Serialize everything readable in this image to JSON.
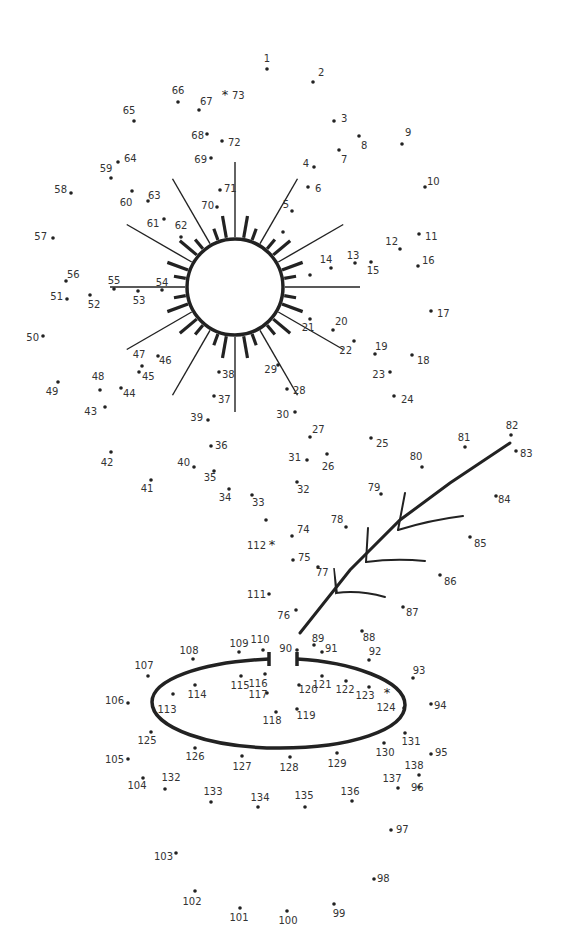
{
  "puzzle": {
    "type": "connect-the-dots",
    "total_points": 138,
    "points": [
      {
        "n": "1",
        "x": 267,
        "y": 69,
        "lx": 267,
        "ly": 62,
        "a": "middle"
      },
      {
        "n": "2",
        "x": 313,
        "y": 82,
        "lx": 318,
        "ly": 76,
        "a": "start"
      },
      {
        "n": "3",
        "x": 334,
        "y": 121,
        "lx": 341,
        "ly": 122,
        "a": "start"
      },
      {
        "n": "4",
        "x": 314,
        "y": 167,
        "lx": 309,
        "ly": 167,
        "a": "end"
      },
      {
        "n": "5",
        "x": 292,
        "y": 211,
        "lx": 289,
        "ly": 208,
        "a": "end"
      },
      {
        "n": "6",
        "x": 308,
        "y": 187,
        "lx": 315,
        "ly": 192,
        "a": "start"
      },
      {
        "n": "7",
        "x": 339,
        "y": 150,
        "lx": 341,
        "ly": 163,
        "a": "start"
      },
      {
        "n": "8",
        "x": 359,
        "y": 136,
        "lx": 361,
        "ly": 149,
        "a": "start"
      },
      {
        "n": "9",
        "x": 402,
        "y": 144,
        "lx": 405,
        "ly": 136,
        "a": "start"
      },
      {
        "n": "10",
        "x": 425,
        "y": 187,
        "lx": 427,
        "ly": 185,
        "a": "start"
      },
      {
        "n": "11",
        "x": 419,
        "y": 234,
        "lx": 425,
        "ly": 240,
        "a": "start"
      },
      {
        "n": "12",
        "x": 400,
        "y": 249,
        "lx": 398,
        "ly": 245,
        "a": "end"
      },
      {
        "n": "13",
        "x": 355,
        "y": 263,
        "lx": 353,
        "ly": 259,
        "a": "middle"
      },
      {
        "n": "14",
        "x": 331,
        "y": 268,
        "lx": 326,
        "ly": 263,
        "a": "middle"
      },
      {
        "n": "15",
        "x": 371,
        "y": 262,
        "lx": 373,
        "ly": 274,
        "a": "middle"
      },
      {
        "n": "16",
        "x": 418,
        "y": 266,
        "lx": 422,
        "ly": 264,
        "a": "start"
      },
      {
        "n": "17",
        "x": 431,
        "y": 311,
        "lx": 437,
        "ly": 317,
        "a": "start"
      },
      {
        "n": "18",
        "x": 412,
        "y": 355,
        "lx": 417,
        "ly": 364,
        "a": "start"
      },
      {
        "n": "19",
        "x": 375,
        "y": 354,
        "lx": 375,
        "ly": 350,
        "a": "start"
      },
      {
        "n": "20",
        "x": 333,
        "y": 330,
        "lx": 335,
        "ly": 325,
        "a": "start"
      },
      {
        "n": "21",
        "x": 310,
        "y": 319,
        "lx": 308,
        "ly": 331,
        "a": "middle"
      },
      {
        "n": "22",
        "x": 354,
        "y": 341,
        "lx": 352,
        "ly": 354,
        "a": "end"
      },
      {
        "n": "23",
        "x": 390,
        "y": 372,
        "lx": 385,
        "ly": 378,
        "a": "end"
      },
      {
        "n": "24",
        "x": 394,
        "y": 396,
        "lx": 401,
        "ly": 403,
        "a": "start"
      },
      {
        "n": "25",
        "x": 371,
        "y": 438,
        "lx": 376,
        "ly": 447,
        "a": "start"
      },
      {
        "n": "26",
        "x": 327,
        "y": 454,
        "lx": 328,
        "ly": 470,
        "a": "middle"
      },
      {
        "n": "27",
        "x": 310,
        "y": 437,
        "lx": 312,
        "ly": 433,
        "a": "start"
      },
      {
        "n": "28",
        "x": 287,
        "y": 389,
        "lx": 293,
        "ly": 394,
        "a": "start"
      },
      {
        "n": "29",
        "x": 278,
        "y": 365,
        "lx": 277,
        "ly": 373,
        "a": "end"
      },
      {
        "n": "30",
        "x": 295,
        "y": 412,
        "lx": 289,
        "ly": 418,
        "a": "end"
      },
      {
        "n": "31",
        "x": 307,
        "y": 460,
        "lx": 301,
        "ly": 461,
        "a": "end"
      },
      {
        "n": "32",
        "x": 297,
        "y": 482,
        "lx": 297,
        "ly": 493,
        "a": "start"
      },
      {
        "n": "33",
        "x": 252,
        "y": 495,
        "lx": 252,
        "ly": 506,
        "a": "start"
      },
      {
        "n": "34",
        "x": 229,
        "y": 489,
        "lx": 225,
        "ly": 501,
        "a": "middle"
      },
      {
        "n": "35",
        "x": 214,
        "y": 471,
        "lx": 210,
        "ly": 481,
        "a": "middle"
      },
      {
        "n": "36",
        "x": 211,
        "y": 446,
        "lx": 215,
        "ly": 449,
        "a": "start"
      },
      {
        "n": "37",
        "x": 214,
        "y": 396,
        "lx": 218,
        "ly": 403,
        "a": "start"
      },
      {
        "n": "38",
        "x": 219,
        "y": 372,
        "lx": 222,
        "ly": 378,
        "a": "start"
      },
      {
        "n": "39",
        "x": 208,
        "y": 420,
        "lx": 203,
        "ly": 421,
        "a": "end"
      },
      {
        "n": "40",
        "x": 194,
        "y": 467,
        "lx": 190,
        "ly": 466,
        "a": "end"
      },
      {
        "n": "41",
        "x": 151,
        "y": 480,
        "lx": 147,
        "ly": 492,
        "a": "middle"
      },
      {
        "n": "42",
        "x": 111,
        "y": 452,
        "lx": 107,
        "ly": 466,
        "a": "middle"
      },
      {
        "n": "43",
        "x": 105,
        "y": 407,
        "lx": 97,
        "ly": 415,
        "a": "end"
      },
      {
        "n": "44",
        "x": 121,
        "y": 388,
        "lx": 123,
        "ly": 397,
        "a": "start"
      },
      {
        "n": "45",
        "x": 139,
        "y": 372,
        "lx": 142,
        "ly": 380,
        "a": "start"
      },
      {
        "n": "46",
        "x": 158,
        "y": 356,
        "lx": 159,
        "ly": 364,
        "a": "start"
      },
      {
        "n": "47",
        "x": 142,
        "y": 366,
        "lx": 139,
        "ly": 358,
        "a": "middle"
      },
      {
        "n": "48",
        "x": 100,
        "y": 390,
        "lx": 98,
        "ly": 380,
        "a": "middle"
      },
      {
        "n": "49",
        "x": 58,
        "y": 382,
        "lx": 52,
        "ly": 395,
        "a": "middle"
      },
      {
        "n": "50",
        "x": 43,
        "y": 336,
        "lx": 39,
        "ly": 341,
        "a": "end"
      },
      {
        "n": "51",
        "x": 67,
        "y": 299,
        "lx": 63,
        "ly": 300,
        "a": "end"
      },
      {
        "n": "52",
        "x": 90,
        "y": 295,
        "lx": 94,
        "ly": 308,
        "a": "middle"
      },
      {
        "n": "53",
        "x": 138,
        "y": 291,
        "lx": 139,
        "ly": 304,
        "a": "middle"
      },
      {
        "n": "54",
        "x": 162,
        "y": 290,
        "lx": 162,
        "ly": 286,
        "a": "middle"
      },
      {
        "n": "55",
        "x": 114,
        "y": 289,
        "lx": 114,
        "ly": 284,
        "a": "middle"
      },
      {
        "n": "56",
        "x": 66,
        "y": 281,
        "lx": 67,
        "ly": 278,
        "a": "start"
      },
      {
        "n": "57",
        "x": 53,
        "y": 238,
        "lx": 47,
        "ly": 240,
        "a": "end"
      },
      {
        "n": "58",
        "x": 71,
        "y": 193,
        "lx": 67,
        "ly": 193,
        "a": "end"
      },
      {
        "n": "59",
        "x": 111,
        "y": 178,
        "lx": 106,
        "ly": 172,
        "a": "middle"
      },
      {
        "n": "60",
        "x": 132,
        "y": 191,
        "lx": 126,
        "ly": 206,
        "a": "middle"
      },
      {
        "n": "61",
        "x": 164,
        "y": 219,
        "lx": 153,
        "ly": 227,
        "a": "middle"
      },
      {
        "n": "62",
        "x": 181,
        "y": 237,
        "lx": 181,
        "ly": 229,
        "a": "middle"
      },
      {
        "n": "63",
        "x": 148,
        "y": 201,
        "lx": 148,
        "ly": 199,
        "a": "start"
      },
      {
        "n": "64",
        "x": 118,
        "y": 162,
        "lx": 124,
        "ly": 162,
        "a": "start"
      },
      {
        "n": "65",
        "x": 134,
        "y": 121,
        "lx": 129,
        "ly": 114,
        "a": "middle"
      },
      {
        "n": "66",
        "x": 178,
        "y": 102,
        "lx": 178,
        "ly": 94,
        "a": "middle"
      },
      {
        "n": "67",
        "x": 199,
        "y": 110,
        "lx": 200,
        "ly": 105,
        "a": "start"
      },
      {
        "n": "68",
        "x": 207,
        "y": 134,
        "lx": 204,
        "ly": 139,
        "a": "end"
      },
      {
        "n": "69",
        "x": 211,
        "y": 158,
        "lx": 207,
        "ly": 163,
        "a": "end"
      },
      {
        "n": "70",
        "x": 217,
        "y": 207,
        "lx": 214,
        "ly": 209,
        "a": "end"
      },
      {
        "n": "71",
        "x": 220,
        "y": 190,
        "lx": 224,
        "ly": 192,
        "a": "start"
      },
      {
        "n": "72",
        "x": 222,
        "y": 141,
        "lx": 228,
        "ly": 146,
        "a": "start"
      },
      {
        "n": "74",
        "x": 292,
        "y": 536,
        "lx": 297,
        "ly": 533,
        "a": "start"
      },
      {
        "n": "75",
        "x": 293,
        "y": 560,
        "lx": 298,
        "ly": 561,
        "a": "start"
      },
      {
        "n": "76",
        "x": 296,
        "y": 610,
        "lx": 290,
        "ly": 619,
        "a": "end"
      },
      {
        "n": "77",
        "x": 318,
        "y": 567,
        "lx": 316,
        "ly": 576,
        "a": "start"
      },
      {
        "n": "78",
        "x": 346,
        "y": 527,
        "lx": 337,
        "ly": 523,
        "a": "middle"
      },
      {
        "n": "79",
        "x": 381,
        "y": 494,
        "lx": 374,
        "ly": 491,
        "a": "middle"
      },
      {
        "n": "80",
        "x": 422,
        "y": 467,
        "lx": 416,
        "ly": 460,
        "a": "middle"
      },
      {
        "n": "81",
        "x": 465,
        "y": 447,
        "lx": 464,
        "ly": 441,
        "a": "middle"
      },
      {
        "n": "82",
        "x": 511,
        "y": 435,
        "lx": 512,
        "ly": 429,
        "a": "middle"
      },
      {
        "n": "83",
        "x": 516,
        "y": 451,
        "lx": 520,
        "ly": 457,
        "a": "start"
      },
      {
        "n": "84",
        "x": 496,
        "y": 496,
        "lx": 498,
        "ly": 503,
        "a": "start"
      },
      {
        "n": "85",
        "x": 470,
        "y": 537,
        "lx": 474,
        "ly": 547,
        "a": "start"
      },
      {
        "n": "86",
        "x": 440,
        "y": 575,
        "lx": 444,
        "ly": 585,
        "a": "start"
      },
      {
        "n": "87",
        "x": 403,
        "y": 607,
        "lx": 406,
        "ly": 616,
        "a": "start"
      },
      {
        "n": "88",
        "x": 362,
        "y": 631,
        "lx": 369,
        "ly": 641,
        "a": "middle"
      },
      {
        "n": "89",
        "x": 314,
        "y": 645,
        "lx": 318,
        "ly": 642,
        "a": "middle"
      },
      {
        "n": "90",
        "x": 297,
        "y": 650,
        "lx": 292,
        "ly": 652,
        "a": "end"
      },
      {
        "n": "91",
        "x": 322,
        "y": 652,
        "lx": 325,
        "ly": 652,
        "a": "start"
      },
      {
        "n": "92",
        "x": 369,
        "y": 660,
        "lx": 375,
        "ly": 655,
        "a": "middle"
      },
      {
        "n": "93",
        "x": 413,
        "y": 678,
        "lx": 419,
        "ly": 674,
        "a": "middle"
      },
      {
        "n": "94",
        "x": 431,
        "y": 704,
        "lx": 434,
        "ly": 709,
        "a": "start"
      },
      {
        "n": "95",
        "x": 431,
        "y": 754,
        "lx": 435,
        "ly": 756,
        "a": "start"
      },
      {
        "n": "96",
        "x": 419,
        "y": 787,
        "lx": 411,
        "ly": 791,
        "a": "start"
      },
      {
        "n": "97",
        "x": 391,
        "y": 830,
        "lx": 396,
        "ly": 833,
        "a": "start"
      },
      {
        "n": "98",
        "x": 374,
        "y": 879,
        "lx": 377,
        "ly": 882,
        "a": "start"
      },
      {
        "n": "99",
        "x": 334,
        "y": 904,
        "lx": 339,
        "ly": 917,
        "a": "middle"
      },
      {
        "n": "100",
        "x": 287,
        "y": 911,
        "lx": 288,
        "ly": 924,
        "a": "middle"
      },
      {
        "n": "101",
        "x": 240,
        "y": 908,
        "lx": 239,
        "ly": 921,
        "a": "middle"
      },
      {
        "n": "102",
        "x": 195,
        "y": 891,
        "lx": 192,
        "ly": 905,
        "a": "middle"
      },
      {
        "n": "103",
        "x": 176,
        "y": 853,
        "lx": 173,
        "ly": 860,
        "a": "end"
      },
      {
        "n": "104",
        "x": 143,
        "y": 778,
        "lx": 137,
        "ly": 789,
        "a": "middle"
      },
      {
        "n": "105",
        "x": 128,
        "y": 759,
        "lx": 124,
        "ly": 763,
        "a": "end"
      },
      {
        "n": "106",
        "x": 128,
        "y": 703,
        "lx": 124,
        "ly": 704,
        "a": "end"
      },
      {
        "n": "107",
        "x": 148,
        "y": 676,
        "lx": 144,
        "ly": 669,
        "a": "middle"
      },
      {
        "n": "108",
        "x": 193,
        "y": 659,
        "lx": 189,
        "ly": 654,
        "a": "middle"
      },
      {
        "n": "109",
        "x": 239,
        "y": 652,
        "lx": 239,
        "ly": 647,
        "a": "middle"
      },
      {
        "n": "110",
        "x": 263,
        "y": 650,
        "lx": 260,
        "ly": 643,
        "a": "middle"
      },
      {
        "n": "111",
        "x": 269,
        "y": 594,
        "lx": 266,
        "ly": 598,
        "a": "end"
      },
      {
        "n": "113",
        "x": 173,
        "y": 694,
        "lx": 167,
        "ly": 713,
        "a": "middle"
      },
      {
        "n": "114",
        "x": 195,
        "y": 685,
        "lx": 197,
        "ly": 698,
        "a": "middle"
      },
      {
        "n": "115",
        "x": 241,
        "y": 676,
        "lx": 240,
        "ly": 689,
        "a": "middle"
      },
      {
        "n": "116",
        "x": 265,
        "y": 674,
        "lx": 258,
        "ly": 687,
        "a": "middle"
      },
      {
        "n": "117",
        "x": 267,
        "y": 693,
        "lx": 258,
        "ly": 698,
        "a": "middle"
      },
      {
        "n": "118",
        "x": 276,
        "y": 712,
        "lx": 272,
        "ly": 724,
        "a": "middle"
      },
      {
        "n": "119",
        "x": 297,
        "y": 709,
        "lx": 306,
        "ly": 719,
        "a": "middle"
      },
      {
        "n": "120",
        "x": 299,
        "y": 685,
        "lx": 308,
        "ly": 693,
        "a": "middle"
      },
      {
        "n": "121",
        "x": 322,
        "y": 676,
        "lx": 322,
        "ly": 688,
        "a": "middle"
      },
      {
        "n": "122",
        "x": 346,
        "y": 681,
        "lx": 345,
        "ly": 693,
        "a": "middle"
      },
      {
        "n": "123",
        "x": 369,
        "y": 687,
        "lx": 365,
        "ly": 699,
        "a": "middle"
      },
      {
        "n": "124",
        "x": 404,
        "y": 708,
        "lx": 386,
        "ly": 711,
        "a": "middle"
      },
      {
        "n": "125",
        "x": 151,
        "y": 732,
        "lx": 147,
        "ly": 744,
        "a": "middle"
      },
      {
        "n": "126",
        "x": 195,
        "y": 748,
        "lx": 195,
        "ly": 760,
        "a": "middle"
      },
      {
        "n": "127",
        "x": 242,
        "y": 756,
        "lx": 242,
        "ly": 770,
        "a": "middle"
      },
      {
        "n": "128",
        "x": 290,
        "y": 757,
        "lx": 289,
        "ly": 771,
        "a": "middle"
      },
      {
        "n": "129",
        "x": 337,
        "y": 753,
        "lx": 337,
        "ly": 767,
        "a": "middle"
      },
      {
        "n": "130",
        "x": 384,
        "y": 743,
        "lx": 385,
        "ly": 756,
        "a": "middle"
      },
      {
        "n": "131",
        "x": 405,
        "y": 733,
        "lx": 411,
        "ly": 745,
        "a": "middle"
      },
      {
        "n": "132",
        "x": 165,
        "y": 789,
        "lx": 171,
        "ly": 781,
        "a": "middle"
      },
      {
        "n": "133",
        "x": 211,
        "y": 802,
        "lx": 213,
        "ly": 795,
        "a": "middle"
      },
      {
        "n": "134",
        "x": 258,
        "y": 807,
        "lx": 260,
        "ly": 801,
        "a": "middle"
      },
      {
        "n": "135",
        "x": 305,
        "y": 807,
        "lx": 304,
        "ly": 799,
        "a": "middle"
      },
      {
        "n": "136",
        "x": 352,
        "y": 801,
        "lx": 350,
        "ly": 795,
        "a": "middle"
      },
      {
        "n": "137",
        "x": 398,
        "y": 788,
        "lx": 392,
        "ly": 782,
        "a": "middle"
      },
      {
        "n": "138",
        "x": 419,
        "y": 775,
        "lx": 414,
        "ly": 769,
        "a": "middle"
      }
    ],
    "start_markers": [
      {
        "n": "73",
        "x": 225,
        "y": 95,
        "lx": 232,
        "ly": 99,
        "a": "start",
        "symbol": "*"
      },
      {
        "n": "112",
        "x": 272,
        "y": 545,
        "lx": 266,
        "ly": 549,
        "a": "end",
        "symbol": "*"
      },
      {
        "n": "124-star",
        "x": 387,
        "y": 693,
        "symbol": "*"
      }
    ],
    "unlabeled_dots": [
      {
        "x": 266,
        "y": 520
      },
      {
        "x": 310,
        "y": 275
      },
      {
        "x": 283,
        "y": 232
      }
    ]
  },
  "colors": {
    "ink": "#222222",
    "label": "#333333",
    "background": "#ffffff"
  }
}
